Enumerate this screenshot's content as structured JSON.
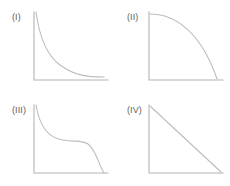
{
  "figure": {
    "background_color": "#ffffff",
    "axis_color": "#b4b4b4",
    "curve_color": "#bdbdbd",
    "label_color": "#5d5d5d"
  },
  "panels": [
    {
      "label": "(I)",
      "curve_name": "steep-exponential-decay-curve",
      "axes_path": "M 4 2 L 4 70 L 78 70",
      "curve_path": "M 6 2 C 9 24, 15 44, 30 55 C 45 66, 58 67, 74 67"
    },
    {
      "label": "(II)",
      "curve_name": "concave-quarter-ellipse-curve",
      "axes_path": "M 4 2 L 4 70 L 78 70",
      "curve_path": "M 5 4 C 30 4, 56 22, 72 69"
    },
    {
      "label": "(III)",
      "curve_name": "plateau-sigmoid-decay-curve",
      "axes_path": "M 4 2 L 4 70 L 78 70",
      "curve_path": "M 6 2 C 9 20, 17 35, 33 37 C 46 39, 52 37, 58 41 C 66 47, 68 60, 74 70"
    },
    {
      "label": "(IV)",
      "curve_name": "straight-linear-decline-line",
      "axes_path": "M 4 2 L 4 70 L 78 70",
      "curve_path": "M 5 3 L 76 69"
    }
  ],
  "chart_data": {
    "type": "line",
    "xlabel": "",
    "ylabel": "",
    "grid": false,
    "legend_position": "none",
    "xlim": [
      0,
      1
    ],
    "ylim": [
      0,
      1
    ],
    "panel_layout": "2x2",
    "charts": [
      {
        "label": "(I)",
        "type": "line",
        "description": "Steep exponential decay flattening to a low plateau above the x-axis",
        "x": [
          0,
          0.1,
          0.2,
          0.3,
          0.4,
          0.5,
          0.6,
          0.7,
          0.8,
          0.9,
          1.0
        ],
        "y": [
          1.0,
          0.63,
          0.4,
          0.27,
          0.19,
          0.14,
          0.11,
          0.09,
          0.08,
          0.07,
          0.06
        ]
      },
      {
        "label": "(II)",
        "type": "line",
        "description": "Concave quarter-ellipse falling slowly then steeply to zero",
        "x": [
          0,
          0.1,
          0.2,
          0.3,
          0.4,
          0.5,
          0.6,
          0.7,
          0.8,
          0.9,
          1.0
        ],
        "y": [
          1.0,
          0.995,
          0.98,
          0.954,
          0.917,
          0.866,
          0.8,
          0.714,
          0.6,
          0.436,
          0.0
        ]
      },
      {
        "label": "(III)",
        "type": "line",
        "description": "Steep initial drop, long middle plateau, then a final steep drop to zero",
        "x": [
          0,
          0.1,
          0.2,
          0.3,
          0.4,
          0.5,
          0.6,
          0.7,
          0.8,
          0.9,
          1.0
        ],
        "y": [
          1.0,
          0.74,
          0.58,
          0.51,
          0.49,
          0.48,
          0.47,
          0.43,
          0.33,
          0.17,
          0.0
        ]
      },
      {
        "label": "(IV)",
        "type": "line",
        "description": "Straight linear decline from maximum to zero",
        "x": [
          0,
          0.1,
          0.2,
          0.3,
          0.4,
          0.5,
          0.6,
          0.7,
          0.8,
          0.9,
          1.0
        ],
        "y": [
          1.0,
          0.9,
          0.8,
          0.7,
          0.6,
          0.5,
          0.4,
          0.3,
          0.2,
          0.1,
          0.0
        ]
      }
    ]
  }
}
